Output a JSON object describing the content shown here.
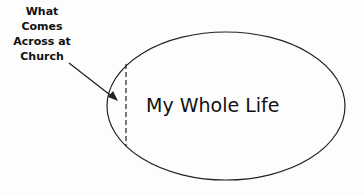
{
  "diagram": {
    "callout_label": [
      "What",
      "Comes",
      "Across at",
      "Church"
    ],
    "ellipse_label": "My Whole Life",
    "colors": {
      "stroke": "#222222",
      "text": "#111111",
      "background": "#fdfdfd"
    }
  }
}
